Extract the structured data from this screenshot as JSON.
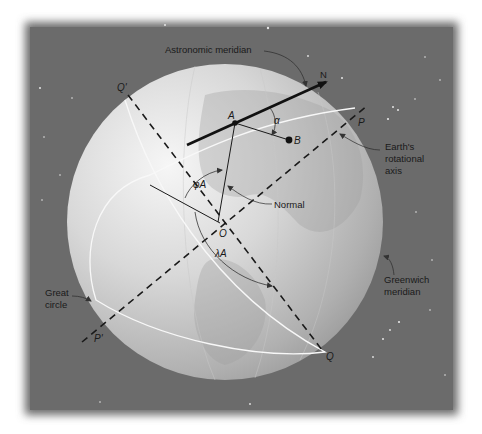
{
  "figure": {
    "colors": {
      "background": "#6b6b6b",
      "globe_light": "#f4f4f4",
      "globe_dark": "#9a9a9a",
      "line": "#1a1a1a",
      "great_circle": "#f7f7f7"
    }
  },
  "labels": {
    "astronomic_meridian": "Astronomic meridian",
    "north": "N",
    "q_prime": "Q'",
    "p": "P",
    "point_a": "A",
    "point_b": "B",
    "alpha": "α",
    "earths_axis_line1": "Earth's",
    "earths_axis_line2": "rotational",
    "earths_axis_line3": "axis",
    "phi_a": "φA",
    "normal": "Normal",
    "origin": "O",
    "lambda_a": "λA",
    "greenwich_line1": "Greenwich",
    "greenwich_line2": "meridian",
    "great_circle_line1": "Great",
    "great_circle_line2": "circle",
    "p_prime": "P'",
    "q": "Q"
  }
}
